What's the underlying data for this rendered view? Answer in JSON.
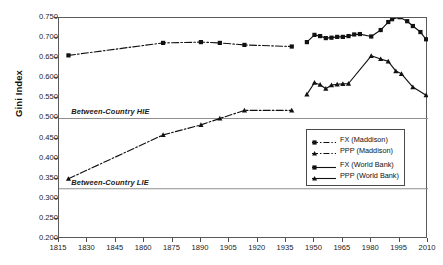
{
  "chart_data": {
    "type": "line",
    "title": "",
    "xlabel": "",
    "ylabel": "Gini Index",
    "xlim": [
      1815,
      2010
    ],
    "ylim": [
      0.2,
      0.75
    ],
    "grid": false,
    "legend_position": "right-middle",
    "x_ticks": [
      1815,
      1830,
      1845,
      1860,
      1875,
      1890,
      1905,
      1920,
      1935,
      1950,
      1965,
      1980,
      1995,
      2010
    ],
    "y_ticks": [
      0.2,
      0.25,
      0.3,
      0.35,
      0.4,
      0.45,
      0.5,
      0.55,
      0.6,
      0.65,
      0.7,
      0.75
    ],
    "y_tick_labels": [
      "0.200",
      "0.250",
      "0.300",
      "0.350",
      "0.400",
      "0.450",
      "0.500",
      "0.550",
      "0.600",
      "0.650",
      "0.700",
      "0.750"
    ],
    "x_tick_labels": [
      "1815",
      "1830",
      "1845",
      "1860",
      "1875",
      "1890",
      "1905",
      "1920",
      "1935",
      "1950",
      "1965",
      "1980",
      "1995",
      "2010"
    ],
    "annotations": [
      {
        "text": "Between-Country HIE",
        "x": 1822,
        "y": 0.5,
        "style": "italic-bold",
        "rule_y": 0.5
      },
      {
        "text": "Between-Country LIE",
        "x": 1822,
        "y": 0.325,
        "style": "italic-bold",
        "rule_y": 0.325
      }
    ],
    "reference_lines": [
      0.5,
      0.325
    ],
    "series": [
      {
        "name": "FX (Maddison)",
        "marker": "square",
        "line_style": "dash-dot",
        "color": "#111111",
        "points": [
          [
            1820,
            0.657
          ],
          [
            1870,
            0.688
          ],
          [
            1890,
            0.69
          ],
          [
            1900,
            0.688
          ],
          [
            1913,
            0.683
          ],
          [
            1938,
            0.679
          ]
        ]
      },
      {
        "name": "PPP (Maddison)",
        "marker": "triangle",
        "line_style": "dash-dot",
        "color": "#111111",
        "points": [
          [
            1820,
            0.35
          ],
          [
            1870,
            0.459
          ],
          [
            1890,
            0.484
          ],
          [
            1900,
            0.5
          ],
          [
            1913,
            0.52
          ],
          [
            1938,
            0.52
          ]
        ]
      },
      {
        "name": "FX (World Bank)",
        "marker": "square",
        "line_style": "solid",
        "color": "#111111",
        "points": [
          [
            1946,
            0.69
          ],
          [
            1950,
            0.708
          ],
          [
            1953,
            0.705
          ],
          [
            1956,
            0.7
          ],
          [
            1959,
            0.701
          ],
          [
            1962,
            0.703
          ],
          [
            1965,
            0.703
          ],
          [
            1968,
            0.705
          ],
          [
            1971,
            0.709
          ],
          [
            1974,
            0.71
          ],
          [
            1980,
            0.704
          ],
          [
            1985,
            0.72
          ],
          [
            1989,
            0.74
          ],
          [
            1991,
            0.747
          ],
          [
            1995,
            0.752
          ],
          [
            1999,
            0.742
          ],
          [
            2002,
            0.73
          ],
          [
            2006,
            0.715
          ],
          [
            2009,
            0.697
          ]
        ]
      },
      {
        "name": "PPP (World Bank)",
        "marker": "triangle",
        "line_style": "solid",
        "color": "#111111",
        "points": [
          [
            1946,
            0.56
          ],
          [
            1950,
            0.589
          ],
          [
            1953,
            0.584
          ],
          [
            1956,
            0.574
          ],
          [
            1959,
            0.583
          ],
          [
            1962,
            0.585
          ],
          [
            1965,
            0.586
          ],
          [
            1968,
            0.587
          ],
          [
            1980,
            0.656
          ],
          [
            1985,
            0.648
          ],
          [
            1989,
            0.642
          ],
          [
            1993,
            0.618
          ],
          [
            1996,
            0.611
          ],
          [
            2002,
            0.578
          ],
          [
            2009,
            0.558
          ]
        ]
      }
    ]
  },
  "legend": {
    "entries": [
      {
        "label": "FX (Maddison)",
        "marker": "square",
        "style": "dash-dot"
      },
      {
        "label": "PPP (Maddison)",
        "marker": "triangle",
        "style": "dash-dot"
      },
      {
        "label": "FX (World Bank)",
        "marker": "square",
        "style": "solid"
      },
      {
        "label": "PPP (World Bank)",
        "marker": "triangle",
        "style": "solid"
      }
    ]
  }
}
